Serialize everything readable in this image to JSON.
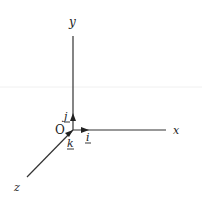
{
  "diagram": {
    "type": "3d-coordinate-axes",
    "origin_label": "O",
    "axes": [
      {
        "name": "x",
        "label": "x"
      },
      {
        "name": "y",
        "label": "y"
      },
      {
        "name": "z",
        "label": "z"
      }
    ],
    "unit_vectors": [
      {
        "name": "i",
        "label": "i",
        "axis": "x"
      },
      {
        "name": "j",
        "label": "j",
        "axis": "y"
      },
      {
        "name": "k",
        "label": "k",
        "axis": "z"
      }
    ],
    "colors": {
      "line": "#333333",
      "background": "#ffffff"
    }
  }
}
